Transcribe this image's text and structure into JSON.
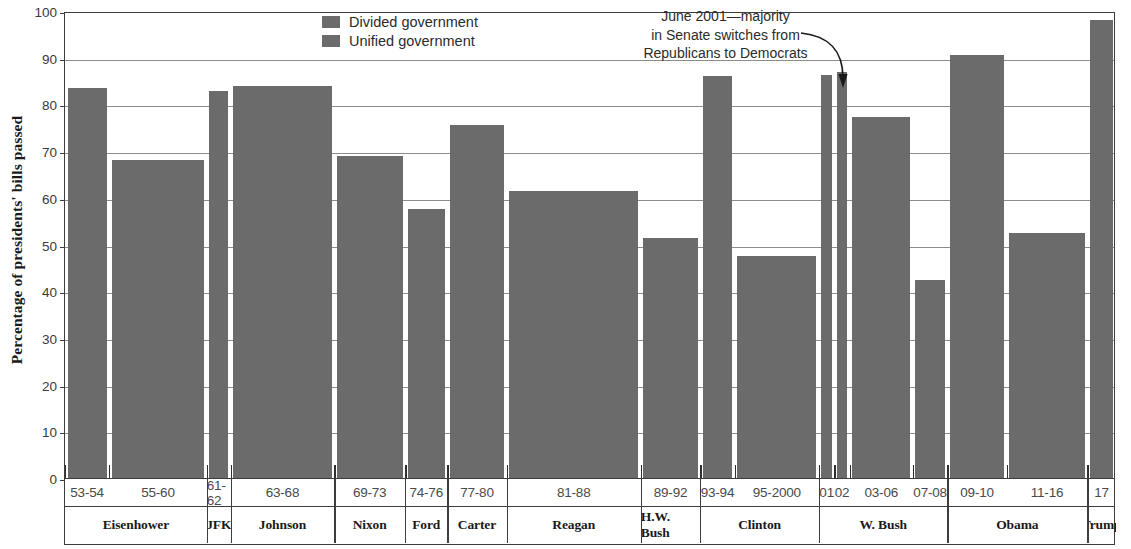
{
  "chart_data": {
    "type": "bar",
    "title": "",
    "xlabel": "",
    "ylabel": "Percentage of presidents' bills passed",
    "ylim": [
      0,
      100
    ],
    "yticks": [
      0,
      10,
      20,
      30,
      40,
      50,
      60,
      70,
      80,
      90,
      100
    ],
    "grid": true,
    "legend_position": "top-center",
    "bar_color": "#6b6b6b",
    "categories": [
      "53-54",
      "55-60",
      "61-62",
      "63-68",
      "69-73",
      "74-76",
      "77-80",
      "81-88",
      "89-92",
      "93-94",
      "95-2000",
      "01",
      "02",
      "03-06",
      "07-08",
      "09-10",
      "11-16",
      "17"
    ],
    "values": [
      83.5,
      68.0,
      82.8,
      83.9,
      68.9,
      57.5,
      75.6,
      61.5,
      51.4,
      86.0,
      47.5,
      86.2,
      87.0,
      77.3,
      42.3,
      90.5,
      52.5,
      98.0
    ],
    "series": [
      {
        "name": "Divided government",
        "points": [
          {
            "label": "53-54",
            "value": 83.5
          },
          {
            "label": "55-60",
            "value": 68.0
          },
          {
            "label": "69-73",
            "value": 68.9
          },
          {
            "label": "74-76",
            "value": 57.5
          },
          {
            "label": "77-80",
            "value": 75.6
          },
          {
            "label": "81-88",
            "value": 61.5
          },
          {
            "label": "89-92",
            "value": 51.4
          },
          {
            "label": "95-2000",
            "value": 47.5
          },
          {
            "label": "02",
            "value": 87.0
          },
          {
            "label": "07-08",
            "value": 42.3
          },
          {
            "label": "11-16",
            "value": 52.5
          }
        ]
      },
      {
        "name": "Unified government",
        "points": [
          {
            "label": "61-62",
            "value": 82.8
          },
          {
            "label": "63-68",
            "value": 83.9
          },
          {
            "label": "93-94",
            "value": 86.0
          },
          {
            "label": "01",
            "value": 86.2
          },
          {
            "label": "03-06",
            "value": 77.3
          },
          {
            "label": "09-10",
            "value": 90.5
          },
          {
            "label": "17",
            "value": 98.0
          }
        ]
      }
    ],
    "annotations": [
      {
        "name": "senate-switch-note",
        "text": "June 2001—majority in Senate switches from Republicans to Democrats",
        "lines": [
          "June 2001—majority",
          "in Senate switches from",
          "Republicans to Democrats"
        ],
        "points_to": "01"
      }
    ]
  },
  "yaxis": {
    "title": "Percentage of presidents' bills passed",
    "ticks": [
      "100",
      "90",
      "80",
      "70",
      "60",
      "50",
      "40",
      "30",
      "20",
      "10",
      "0"
    ]
  },
  "legend": {
    "items": [
      {
        "label": "Divided government",
        "color": "#6b6b6b"
      },
      {
        "label": "Unified government",
        "color": "#6b6b6b"
      }
    ]
  },
  "annotation": {
    "line1": "June 2001—majority",
    "line2": "in Senate switches from",
    "line3": "Republicans to Democrats"
  },
  "xaxis": {
    "years": [
      "53-54",
      "55-60",
      "61-62",
      "63-68",
      "69-73",
      "74-76",
      "77-80",
      "81-88",
      "89-92",
      "93-94",
      "95-2000",
      "01",
      "02",
      "03-06",
      "07-08",
      "09-10",
      "11-16",
      "17"
    ],
    "presidents": [
      "Eisenhower",
      "JFK",
      "Johnson",
      "Nixon",
      "Ford",
      "Carter",
      "Reagan",
      "H.W. Bush",
      "Clinton",
      "W. Bush",
      "Obama",
      "Trump"
    ]
  }
}
